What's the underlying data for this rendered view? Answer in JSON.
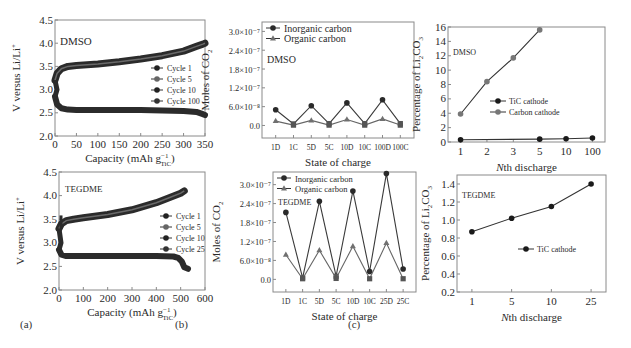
{
  "figure": {
    "panel_labels": [
      "(a)",
      "(b)",
      "(c)"
    ]
  },
  "chart_data": [
    {
      "id": "a_top",
      "type": "line",
      "title": "",
      "annotation": "DMSO",
      "xlabel": "Capacity (mAh g",
      "xlabel_sup": "−1",
      "xlabel_sub": "TiC",
      "ylabel": "V versus Li/Li",
      "ylabel_sup": "+",
      "xlim": [
        0,
        350
      ],
      "ylim": [
        2.0,
        4.5
      ],
      "xticks": [
        0,
        50,
        100,
        150,
        200,
        250,
        300,
        350
      ],
      "yticks": [
        2.0,
        2.5,
        3.0,
        3.5,
        4.0,
        4.5
      ],
      "ytick_labels": [
        "2.0",
        "2.5",
        "3.0",
        "3.5",
        "4.0",
        "4.5"
      ],
      "grid": false,
      "legend": [
        "Cycle 1",
        "Cycle 5",
        "Cycle 10",
        "Cycle 100"
      ],
      "legend_position": "center-right",
      "series": [
        {
          "name": "charge",
          "x": [
            0,
            5,
            15,
            30,
            50,
            100,
            150,
            200,
            250,
            300,
            330,
            345,
            350
          ],
          "y": [
            3.2,
            3.35,
            3.45,
            3.5,
            3.52,
            3.55,
            3.6,
            3.66,
            3.73,
            3.83,
            3.93,
            3.98,
            4.0
          ]
        },
        {
          "name": "discharge",
          "x": [
            0,
            5,
            15,
            30,
            50,
            100,
            150,
            200,
            250,
            300,
            330,
            345,
            350
          ],
          "y": [
            2.85,
            2.68,
            2.6,
            2.57,
            2.56,
            2.56,
            2.56,
            2.56,
            2.55,
            2.54,
            2.52,
            2.47,
            2.45
          ]
        }
      ]
    },
    {
      "id": "a_bot",
      "type": "line",
      "annotation": "TEGDME",
      "xlabel": "Capacity (mAh g",
      "xlabel_sup": "−1",
      "xlabel_sub": "TiC",
      "ylabel": "V versus Li/Li",
      "ylabel_sup": "+",
      "xlim": [
        0,
        600
      ],
      "ylim": [
        2.0,
        4.5
      ],
      "xticks": [
        0,
        100,
        200,
        300,
        400,
        500,
        600
      ],
      "yticks": [
        2.0,
        2.5,
        3.0,
        3.5,
        4.0,
        4.5
      ],
      "ytick_labels": [
        "2.0",
        "2.5",
        "3.0",
        "3.5",
        "4.0",
        "4.5"
      ],
      "grid": false,
      "legend": [
        "Cycle 1",
        "Cycle 5",
        "Cycle 10",
        "Cycle 25"
      ],
      "legend_position": "center-right",
      "series": [
        {
          "name": "charge",
          "x": [
            0,
            10,
            30,
            60,
            100,
            200,
            300,
            400,
            450,
            500,
            515
          ],
          "y": [
            3.3,
            3.4,
            3.47,
            3.5,
            3.53,
            3.6,
            3.7,
            3.85,
            3.95,
            4.05,
            4.1
          ]
        },
        {
          "name": "discharge",
          "x": [
            0,
            10,
            30,
            60,
            100,
            200,
            300,
            400,
            470,
            490,
            505,
            515,
            530
          ],
          "y": [
            2.85,
            2.75,
            2.72,
            2.72,
            2.72,
            2.72,
            2.72,
            2.72,
            2.71,
            2.68,
            2.6,
            2.48,
            2.45
          ]
        }
      ]
    },
    {
      "id": "b_top",
      "type": "line",
      "annotation": "DMSO",
      "xlabel": "State of charge",
      "ylabel": "Moles of CO",
      "ylabel_sub": "2",
      "categories": [
        "1D",
        "1C",
        "5D",
        "5C",
        "10D",
        "10C",
        "100D",
        "100C"
      ],
      "ylim": [
        -4e-08,
        3.3e-07
      ],
      "yticks": [
        0,
        6e-08,
        1.2e-07,
        1.8e-07,
        2.4e-07,
        3e-07
      ],
      "ytick_labels": [
        "0.0",
        "6.0×10⁻⁸",
        "1.2×10⁻⁷",
        "1.8×10⁻⁷",
        "2.4×10⁻⁷",
        "3.0×10⁻⁷"
      ],
      "grid": false,
      "legend_position": "upper-left",
      "series": [
        {
          "name": "Inorganic carbon",
          "marker": "circle",
          "values": [
            5e-08,
            5e-09,
            6.3e-08,
            6e-09,
            7.2e-08,
            6e-09,
            8.2e-08,
            6e-09
          ]
        },
        {
          "name": "Organic carbon",
          "marker": "triangle",
          "values": [
            1.4e-08,
            1e-09,
            1.6e-08,
            1e-09,
            1.9e-08,
            1e-09,
            2.1e-08,
            1e-09
          ]
        }
      ]
    },
    {
      "id": "b_bot",
      "type": "line",
      "annotation": "TEGDME",
      "xlabel": "State of charge",
      "ylabel": "Moles of CO",
      "ylabel_sub": "2",
      "categories": [
        "1D",
        "1C",
        "5D",
        "5C",
        "10D",
        "10C",
        "25D",
        "25C"
      ],
      "ylim": [
        -4e-08,
        3.4e-07
      ],
      "yticks": [
        0,
        6e-08,
        1.2e-07,
        1.8e-07,
        2.4e-07,
        3e-07
      ],
      "ytick_labels": [
        "0.0",
        "6.0×10⁻⁸",
        "1.2×10⁻⁷",
        "1.8×10⁻⁷",
        "2.4×10⁻⁷",
        "3.0×10⁻⁷"
      ],
      "grid": false,
      "legend_position": "upper-left",
      "series": [
        {
          "name": "Inorganic carbon",
          "marker": "circle",
          "values": [
            2.12e-07,
            5e-09,
            2.47e-07,
            1e-08,
            2.8e-07,
            2.5e-08,
            3.35e-07,
            3.3e-08
          ]
        },
        {
          "name": "Organic carbon",
          "marker": "triangle",
          "values": [
            7.8e-08,
            2e-09,
            9.2e-08,
            3e-09,
            1.05e-07,
            2e-09,
            1.15e-07,
            2e-09
          ]
        }
      ]
    },
    {
      "id": "c_top",
      "type": "line",
      "annotation": "DMSO",
      "xlabel": "Nth discharge",
      "xlabel_italic": "N",
      "ylabel": "Percentage of Li",
      "ylabel_sub1": "2",
      "ylabel_mid": "CO",
      "ylabel_sub2": "3",
      "categories": [
        "1",
        "2",
        "3",
        "5",
        "10",
        "100"
      ],
      "ylim": [
        0,
        16
      ],
      "yticks": [
        0,
        2,
        4,
        6,
        8,
        10,
        12,
        14,
        16
      ],
      "ytick_labels": [
        "0",
        "2",
        "4",
        "6",
        "8",
        "10",
        "12",
        "14",
        "16"
      ],
      "grid": false,
      "legend_position": "center",
      "series": [
        {
          "name": "TiC cathode",
          "color": "#1a1a1a",
          "values": [
            0.3,
            null,
            null,
            0.4,
            0.45,
            0.55
          ]
        },
        {
          "name": "Carbon cathode",
          "color": "#777777",
          "values": [
            3.9,
            8.4,
            11.7,
            15.6,
            null,
            null
          ]
        }
      ]
    },
    {
      "id": "c_bot",
      "type": "line",
      "annotation": "TEGDME",
      "xlabel": "Nth discharge",
      "xlabel_italic": "N",
      "ylabel": "Percentage of Li",
      "ylabel_sub1": "2",
      "ylabel_mid": "CO",
      "ylabel_sub2": "3",
      "categories": [
        "1",
        "5",
        "10",
        "25"
      ],
      "ylim": [
        0.2,
        1.5
      ],
      "yticks": [
        0.2,
        0.4,
        0.6,
        0.8,
        1.0,
        1.2,
        1.4
      ],
      "ytick_labels": [
        "0.2",
        "0.4",
        "0.6",
        "0.8",
        "1.0",
        "1.2",
        "1.4"
      ],
      "grid": false,
      "legend_position": "center-right",
      "series": [
        {
          "name": "TiC cathode",
          "color": "#1a1a1a",
          "values": [
            0.87,
            1.02,
            1.15,
            1.4
          ]
        }
      ]
    }
  ]
}
